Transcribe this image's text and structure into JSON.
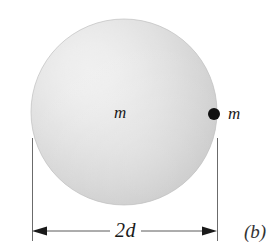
{
  "figure": {
    "panel_label": "(b)",
    "background_color": "#ffffff",
    "width": 278,
    "height": 246
  },
  "sphere": {
    "mass_label": "m",
    "center_x": 124,
    "center_y": 112,
    "radius": 93,
    "highlight_x": 88,
    "highlight_y": 76,
    "highlight_color": "#fdfdfd",
    "mid_color": "#e2e2e2",
    "edge_color": "#c2c2c2",
    "outline_color": "#bdbdbd"
  },
  "particle": {
    "mass_label": "m",
    "dot_x": 214,
    "dot_y": 114,
    "dot_radius": 6,
    "dot_color": "#111111",
    "label_x": 228,
    "label_y": 106
  },
  "dimension": {
    "label": "2d",
    "line_y": 231,
    "left_x": 32,
    "right_x": 217,
    "extension_top_y": 138,
    "extension_bottom_y": 241,
    "line_color": "#5a5a5a",
    "arrow_color": "#1a1a1a"
  }
}
